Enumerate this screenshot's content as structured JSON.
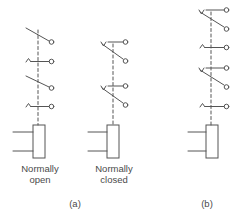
{
  "figure": {
    "panel_a": {
      "caption": "(a)",
      "normally_open": {
        "label_line1": "Normally",
        "label_line2": "open"
      },
      "normally_closed": {
        "label_line1": "Normally",
        "label_line2": "closed"
      }
    },
    "panel_b": {
      "caption": "(b)"
    }
  },
  "colors": {
    "stroke": "#555555",
    "background": "#ffffff"
  }
}
